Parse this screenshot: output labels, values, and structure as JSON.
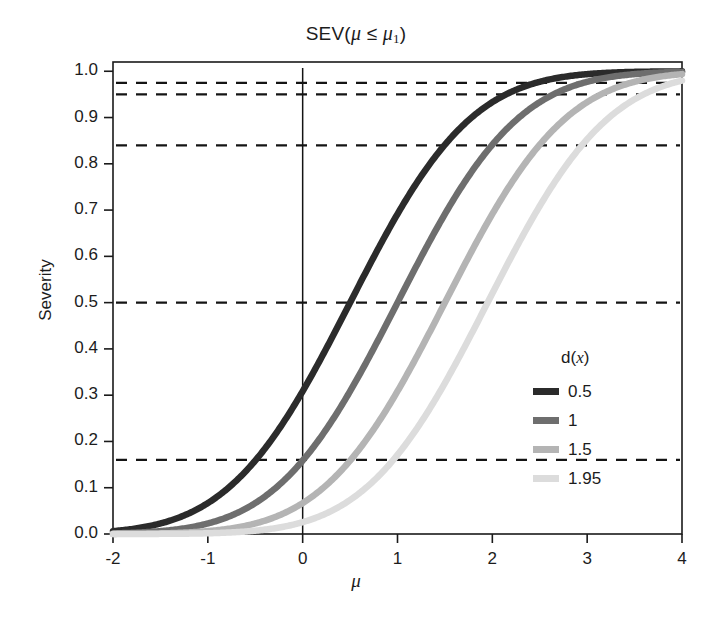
{
  "chart_data": {
    "type": "line",
    "title_main": "SEV(",
    "title_mu": "μ",
    "title_le": " ≤ ",
    "title_mu2": "μ",
    "title_sub": "1",
    "title_close": ")",
    "xlabel": "μ",
    "ylabel": "Severity",
    "xlim": [
      -2,
      4
    ],
    "ylim": [
      0,
      1.02
    ],
    "grid": false,
    "legend_position": "right-middle",
    "legend_title": "d(x)",
    "legend_title_prefix": "d(",
    "legend_title_var": "x",
    "legend_title_suffix": ")",
    "x_ticks": [
      "-2",
      "-1",
      "0",
      "1",
      "2",
      "3",
      "4"
    ],
    "x_tick_values": [
      -2,
      -1,
      0,
      1,
      2,
      3,
      4
    ],
    "y_ticks": [
      "0.0",
      "0.1",
      "0.2",
      "0.3",
      "0.4",
      "0.5",
      "0.6",
      "0.7",
      "0.8",
      "0.9",
      "1.0"
    ],
    "y_tick_values": [
      0.0,
      0.1,
      0.2,
      0.3,
      0.4,
      0.5,
      0.6,
      0.7,
      0.8,
      0.9,
      1.0
    ],
    "formula": "SEV(mu) = Phi(mu - d)",
    "reference_lines_horizontal": [
      0.975,
      0.95,
      0.84,
      0.5,
      0.16
    ],
    "reference_line_vertical": 0,
    "series": [
      {
        "name": "0.5",
        "d": 0.5,
        "color": "#2b2b2b",
        "x": [
          -2,
          -1.75,
          -1.5,
          -1.25,
          -1,
          -0.75,
          -0.5,
          -0.25,
          0,
          0.25,
          0.5,
          0.75,
          1,
          1.25,
          1.5,
          1.75,
          2,
          2.25,
          2.5,
          2.75,
          3,
          3.25,
          3.5,
          3.75,
          4
        ],
        "values": [
          0.0062,
          0.0122,
          0.0228,
          0.0401,
          0.0668,
          0.1056,
          0.1587,
          0.2266,
          0.3085,
          0.4013,
          0.5,
          0.5987,
          0.6915,
          0.7734,
          0.8413,
          0.8944,
          0.9332,
          0.9599,
          0.9772,
          0.9878,
          0.9938,
          0.997,
          0.9987,
          0.9994,
          0.9998
        ]
      },
      {
        "name": "1",
        "d": 1,
        "color": "#6e6e6e",
        "x": [
          -2,
          -1.75,
          -1.5,
          -1.25,
          -1,
          -0.75,
          -0.5,
          -0.25,
          0,
          0.25,
          0.5,
          0.75,
          1,
          1.25,
          1.5,
          1.75,
          2,
          2.25,
          2.5,
          2.75,
          3,
          3.25,
          3.5,
          3.75,
          4
        ],
        "values": [
          0.0013,
          0.003,
          0.0062,
          0.0122,
          0.0228,
          0.0401,
          0.0668,
          0.1056,
          0.1587,
          0.2266,
          0.3085,
          0.4013,
          0.5,
          0.5987,
          0.6915,
          0.7734,
          0.8413,
          0.8944,
          0.9332,
          0.9599,
          0.9772,
          0.9878,
          0.9938,
          0.997,
          0.9987
        ]
      },
      {
        "name": "1.5",
        "d": 1.5,
        "color": "#b4b4b4",
        "x": [
          -2,
          -1.75,
          -1.5,
          -1.25,
          -1,
          -0.75,
          -0.5,
          -0.25,
          0,
          0.25,
          0.5,
          0.75,
          1,
          1.25,
          1.5,
          1.75,
          2,
          2.25,
          2.5,
          2.75,
          3,
          3.25,
          3.5,
          3.75,
          4
        ],
        "values": [
          0.0002,
          0.0006,
          0.0013,
          0.003,
          0.0062,
          0.0122,
          0.0228,
          0.0401,
          0.0668,
          0.1056,
          0.1587,
          0.2266,
          0.3085,
          0.4013,
          0.5,
          0.5987,
          0.6915,
          0.7734,
          0.8413,
          0.8944,
          0.9332,
          0.9599,
          0.9772,
          0.9878,
          0.9938
        ]
      },
      {
        "name": "1.95",
        "d": 1.95,
        "color": "#dcdcdc",
        "x": [
          -2,
          -1.75,
          -1.5,
          -1.25,
          -1,
          -0.75,
          -0.5,
          -0.25,
          0,
          0.25,
          0.5,
          0.75,
          1,
          1.25,
          1.5,
          1.75,
          2,
          2.25,
          2.5,
          2.75,
          3,
          3.25,
          3.5,
          3.75,
          4
        ],
        "values": [
          4e-05,
          0.0001,
          0.0003,
          0.0007,
          0.0016,
          0.0035,
          0.0071,
          0.0136,
          0.0256,
          0.0446,
          0.0735,
          0.1151,
          0.1711,
          0.242,
          0.3264,
          0.4207,
          0.5199,
          0.6179,
          0.7088,
          0.7881,
          0.8531,
          0.9032,
          0.9394,
          0.9641,
          0.9798
        ]
      }
    ]
  },
  "legend": {
    "title": "d(x)",
    "items": [
      {
        "label": "0.5",
        "color": "#2b2b2b"
      },
      {
        "label": "1",
        "color": "#6e6e6e"
      },
      {
        "label": "1.5",
        "color": "#b4b4b4"
      },
      {
        "label": "1.95",
        "color": "#dcdcdc"
      }
    ]
  },
  "axes": {
    "frame_color": "#1a1a1a",
    "reference_line_color": "#141414"
  }
}
